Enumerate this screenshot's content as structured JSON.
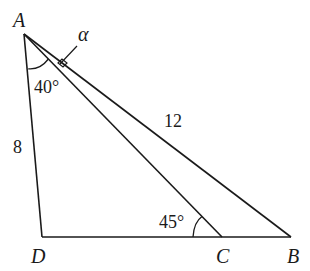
{
  "diagram": {
    "points": {
      "A": {
        "label": "A",
        "x": 24,
        "y": 34
      },
      "B": {
        "label": "B",
        "x": 291,
        "y": 237
      },
      "C": {
        "label": "C",
        "x": 222,
        "y": 237
      },
      "D": {
        "label": "D",
        "x": 42,
        "y": 237
      }
    },
    "labels": {
      "side_AD": "8",
      "side_AB": "12",
      "angle_DAC": "40°",
      "angle_ACD": "45°",
      "angle_alpha": "α"
    },
    "colors": {
      "stroke": "#1a1a1a",
      "background": "#ffffff"
    }
  }
}
